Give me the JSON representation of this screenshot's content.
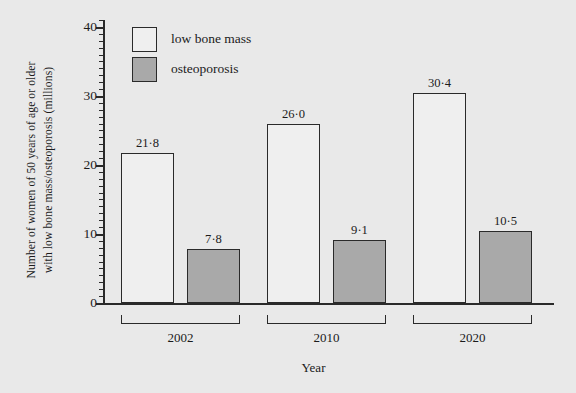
{
  "chart_data": {
    "type": "bar",
    "title": "",
    "subtitle": "",
    "xlabel": "Year",
    "ylabel": "Number of women of 50 years of age or older with low bone mass/osteoporosis (millions)",
    "ylabel_line1": "Number of women of 50 years of age or older",
    "ylabel_line2": "with low bone mass/osteoporosis (millions)",
    "categories": [
      "2002",
      "2010",
      "2020"
    ],
    "series": [
      {
        "name": "low bone mass",
        "values": [
          21.8,
          26.0,
          30.4
        ],
        "labels": [
          "21·8",
          "26·0",
          "30·4"
        ],
        "color": "#efefef",
        "edge_color": "#2a2a2a"
      },
      {
        "name": "osteoporosis",
        "values": [
          7.8,
          9.1,
          10.5
        ],
        "labels": [
          "7·8",
          "9·1",
          "10·5"
        ],
        "color": "#a9a9a9",
        "edge_color": "#2a2a2a"
      }
    ],
    "ylim": [
      0,
      41
    ],
    "ytick_values": [
      0,
      10,
      20,
      30,
      40
    ],
    "ytick_labels": [
      "0",
      "10",
      "20",
      "30",
      "40"
    ],
    "ytick_minor_step": 1,
    "grid": false,
    "legend_position": "top-left",
    "value_label_separator": "middle-dot",
    "background_color": "#e9e9e9",
    "axis_color": "#2a2a2a"
  },
  "legend": {
    "items": [
      {
        "label": "low bone mass",
        "swatch": "light"
      },
      {
        "label": "osteoporosis",
        "swatch": "dark"
      }
    ]
  },
  "axes": {
    "y_title_line1": "Number of women of 50 years of age or older",
    "y_title_line2": "with low bone mass/osteoporosis (millions)",
    "x_title": "Year",
    "y_ticks": [
      {
        "label": "40",
        "value": 40
      },
      {
        "label": "30",
        "value": 30
      },
      {
        "label": "20",
        "value": 20
      },
      {
        "label": "10",
        "value": 10
      },
      {
        "label": "0",
        "value": 0
      }
    ]
  },
  "groups": [
    {
      "year": "2002",
      "bars": [
        {
          "series": "low bone mass",
          "value": 21.8,
          "label": "21·8"
        },
        {
          "series": "osteoporosis",
          "value": 7.8,
          "label": "7·8"
        }
      ]
    },
    {
      "year": "2010",
      "bars": [
        {
          "series": "low bone mass",
          "value": 26.0,
          "label": "26·0"
        },
        {
          "series": "osteoporosis",
          "value": 9.1,
          "label": "9·1"
        }
      ]
    },
    {
      "year": "2020",
      "bars": [
        {
          "series": "low bone mass",
          "value": 30.4,
          "label": "30·4"
        },
        {
          "series": "osteoporosis",
          "value": 10.5,
          "label": "10·5"
        }
      ]
    }
  ]
}
